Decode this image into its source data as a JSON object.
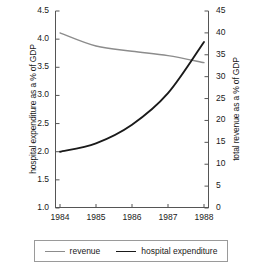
{
  "chart_data": {
    "type": "line",
    "title": "",
    "xlabel": "",
    "categories": [
      "1984",
      "1985",
      "1986",
      "1987",
      "1988"
    ],
    "x": [
      1984,
      1985,
      1986,
      1987,
      1988
    ],
    "grid": false,
    "legend_position": "bottom",
    "axes": {
      "left": {
        "label": "hospital expenditure as a % of GDP",
        "min": 1.0,
        "max": 4.5,
        "step": 0.5,
        "ticks": [
          "1.0",
          "1.5",
          "2.0",
          "2.5",
          "3.0",
          "3.5",
          "4.0",
          "4.5"
        ],
        "tick_values": [
          1.0,
          1.5,
          2.0,
          2.5,
          3.0,
          3.5,
          4.0,
          4.5
        ]
      },
      "right": {
        "label": "total revenue as a % of GDP",
        "min": 0,
        "max": 45,
        "step": 5,
        "ticks": [
          "0",
          "5",
          "10",
          "15",
          "20",
          "25",
          "30",
          "35",
          "40",
          "45"
        ],
        "tick_values": [
          0,
          5,
          10,
          15,
          20,
          25,
          30,
          35,
          40,
          45
        ]
      }
    },
    "series": [
      {
        "name": "revenue",
        "axis": "right",
        "color": "#8c8c8c",
        "width": 1.4,
        "values": [
          40.0,
          37.0,
          35.8,
          34.8,
          33.2
        ]
      },
      {
        "name": "hospital expenditure",
        "axis": "left",
        "color": "#1a1a1a",
        "width": 1.9,
        "values": [
          2.0,
          2.15,
          2.48,
          3.04,
          3.95
        ]
      }
    ]
  },
  "legend": {
    "entries": [
      {
        "label": "revenue",
        "color": "#8c8c8c"
      },
      {
        "label": "hospital expenditure",
        "color": "#1a1a1a"
      }
    ]
  }
}
